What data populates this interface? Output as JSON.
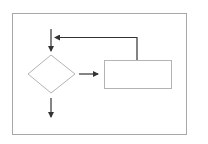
{
  "diagram": {
    "type": "flowchart",
    "colors": {
      "background": "#ffffff",
      "frame": "#a8a8a8",
      "shape_stroke": "#b4b4b4",
      "arrow": "#333333"
    },
    "nodes": [
      {
        "id": "decision",
        "shape": "diamond",
        "label": ""
      },
      {
        "id": "process",
        "shape": "rectangle",
        "label": ""
      }
    ],
    "edges": [
      {
        "from": "entry",
        "to": "decision",
        "direction": "down"
      },
      {
        "from": "decision",
        "to": "process",
        "direction": "right"
      },
      {
        "from": "process",
        "to": "entry",
        "direction": "loop-back"
      },
      {
        "from": "decision",
        "to": "exit",
        "direction": "down"
      }
    ]
  }
}
